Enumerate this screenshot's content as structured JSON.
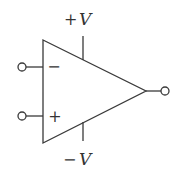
{
  "diagram": {
    "type": "op-amp-symbol",
    "supply_positive_label": "+V",
    "supply_negative_label": "−V",
    "supply_positive_sign": "+",
    "supply_positive_var": "V",
    "supply_negative_sign": "−",
    "supply_negative_var": "V",
    "inverting_input_sign": "−",
    "noninverting_input_sign": "+",
    "colors": {
      "stroke": "#3a3a3a",
      "background": "#ffffff"
    }
  }
}
